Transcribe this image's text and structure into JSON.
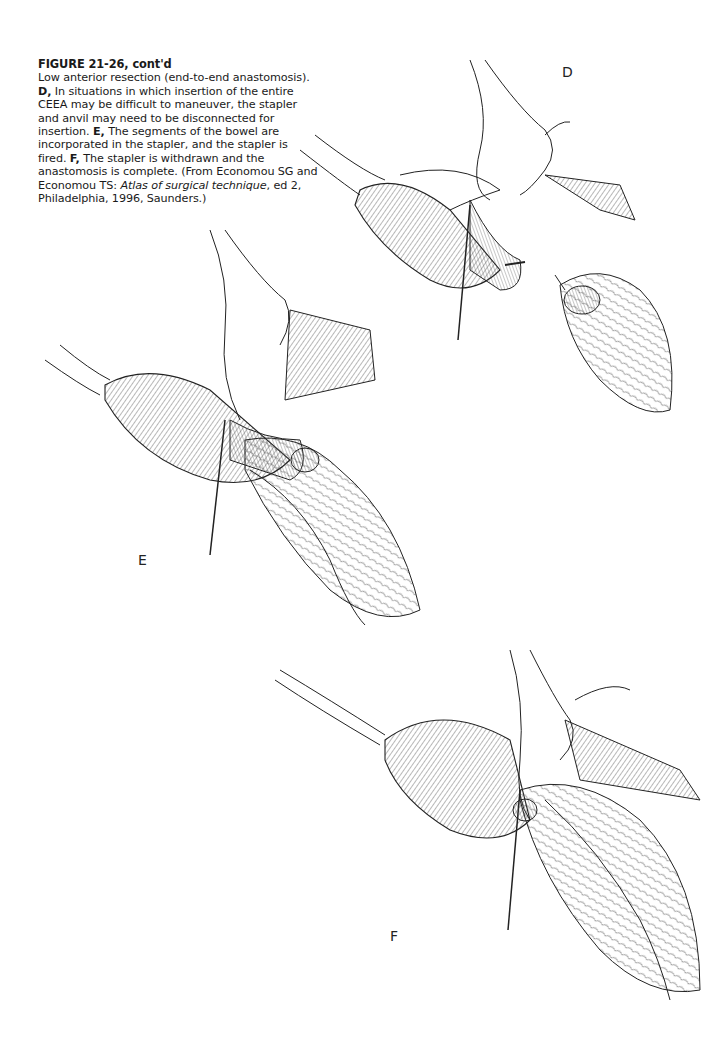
{
  "figure": {
    "title": "FIGURE 21-26, cont'd",
    "caption_intro": "Low anterior resection (end-to-end anastomosis).",
    "parts": [
      {
        "label": "D,",
        "text": "In situations in which insertion of the entire CEEA may be difficult to maneuver, the stapler and anvil may need to be disconnected for insertion."
      },
      {
        "label": "E,",
        "text": "The segments of the bowel are incorporated in the stapler, and the stapler is fired."
      },
      {
        "label": "F,",
        "text": "The stapler is withdrawn and the anastomosis is complete."
      }
    ],
    "source_prefix": "(From Economou SG and Economou TS:",
    "source_title": "Atlas of surgical technique",
    "source_suffix": ", ed 2, Philadelphia, 1996, Saunders.)"
  },
  "panels": [
    {
      "label": "D",
      "description": "Stapler and anvil disconnected for insertion into bowel"
    },
    {
      "label": "E",
      "description": "Bowel segments incorporated in stapler, stapler fired"
    },
    {
      "label": "F",
      "description": "Stapler withdrawn, anastomosis complete"
    }
  ]
}
